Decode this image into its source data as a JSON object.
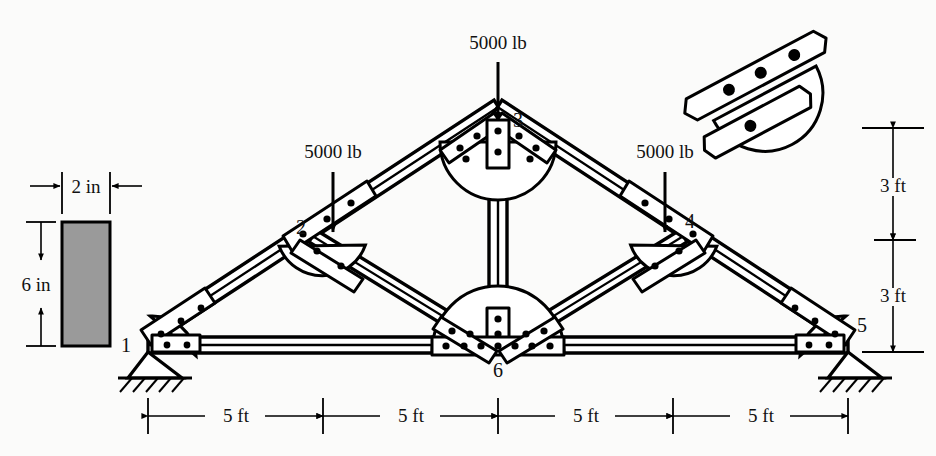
{
  "figure": {
    "type": "engineering-diagram",
    "background_color": "#fbfbfa",
    "line_color": "#000000",
    "section_fill_color": "#9a9a9a"
  },
  "loads": [
    {
      "id": "load-node-2",
      "label": "5000 lb",
      "at_node": "2",
      "direction": "down",
      "x": 333,
      "y": 158,
      "arrow_x": 333,
      "arrow_y0": 172,
      "arrow_y1": 228
    },
    {
      "id": "load-node-3",
      "label": "5000 lb",
      "at_node": "3",
      "direction": "down",
      "x": 498,
      "y": 49,
      "arrow_x": 498,
      "arrow_y0": 62,
      "arrow_y1": 117
    },
    {
      "id": "load-node-4",
      "label": "5000 lb",
      "at_node": "4",
      "direction": "down",
      "x": 665,
      "y": 158,
      "arrow_x": 665,
      "arrow_y0": 172,
      "arrow_y1": 228
    }
  ],
  "nodes": [
    {
      "id": "1",
      "label": "1",
      "x": 148,
      "y": 345,
      "label_x": 126,
      "label_y": 352,
      "support": "pin"
    },
    {
      "id": "2",
      "label": "2",
      "x": 323,
      "y": 236,
      "label_x": 303,
      "label_y": 232,
      "support": "none"
    },
    {
      "id": "3",
      "label": "3",
      "x": 498,
      "y": 120,
      "label_x": 516,
      "label_y": 126,
      "support": "none"
    },
    {
      "id": "4",
      "label": "4",
      "x": 673,
      "y": 236,
      "label_x": 688,
      "label_y": 228,
      "support": "none"
    },
    {
      "id": "5",
      "label": "5",
      "x": 848,
      "y": 345,
      "label_x": 860,
      "label_y": 332,
      "support": "pin"
    },
    {
      "id": "6",
      "label": "6",
      "x": 498,
      "y": 345,
      "label_x": 498,
      "label_y": 374,
      "support": "none"
    }
  ],
  "members": [
    {
      "id": "m-1-2",
      "from": "1",
      "to": "2",
      "kind": "top-chord"
    },
    {
      "id": "m-2-3",
      "from": "2",
      "to": "3",
      "kind": "top-chord"
    },
    {
      "id": "m-3-4",
      "from": "3",
      "to": "4",
      "kind": "top-chord"
    },
    {
      "id": "m-4-5",
      "from": "4",
      "to": "5",
      "kind": "top-chord"
    },
    {
      "id": "m-1-6",
      "from": "1",
      "to": "6",
      "kind": "bottom-chord"
    },
    {
      "id": "m-6-5",
      "from": "6",
      "to": "5",
      "kind": "bottom-chord"
    },
    {
      "id": "m-3-6",
      "from": "3",
      "to": "6",
      "kind": "vertical-web"
    },
    {
      "id": "m-2-6",
      "from": "2",
      "to": "6",
      "kind": "diagonal-web"
    },
    {
      "id": "m-4-6",
      "from": "4",
      "to": "6",
      "kind": "diagonal-web"
    }
  ],
  "dimensions": {
    "horizontal": {
      "y": 415,
      "ticks": [
        148,
        323,
        498,
        673,
        848
      ],
      "spans": [
        {
          "id": "dim-span-1",
          "label": "5 ft",
          "x0": 148,
          "x1": 323
        },
        {
          "id": "dim-span-2",
          "label": "5 ft",
          "x0": 323,
          "x1": 498
        },
        {
          "id": "dim-span-3",
          "label": "5 ft",
          "x0": 498,
          "x1": 673
        },
        {
          "id": "dim-span-4",
          "label": "5 ft",
          "x0": 673,
          "x1": 848
        }
      ]
    },
    "vertical": {
      "x": 893,
      "spans": [
        {
          "id": "dim-height-upper",
          "label": "3 ft",
          "y0": 128,
          "y1": 240
        },
        {
          "id": "dim-height-lower",
          "label": "3 ft",
          "y0": 240,
          "y1": 352
        }
      ],
      "rule_x0": 862,
      "rule_x1": 924
    }
  },
  "cross_section": {
    "id": "beam-cross-section",
    "x": 62,
    "y": 222,
    "width": 48,
    "height": 124,
    "width_label": "2 in",
    "height_label": "6 in",
    "width_label_x": 86,
    "width_label_y": 190,
    "height_label_x": 36,
    "height_label_y": 290,
    "dim_top_y": 178,
    "dim_left_x": 40
  },
  "detail_inset": {
    "id": "joint-detail-inset",
    "description": "enlarged bolted gusset joint",
    "center_x": 762,
    "center_y": 88,
    "rotation_deg": -28,
    "bolt_count": 4
  }
}
